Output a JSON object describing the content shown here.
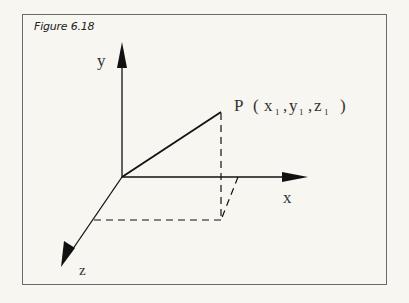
{
  "figure": {
    "caption": "Figure 6.18",
    "axes": {
      "x_label": "x",
      "y_label": "y",
      "z_label": "z"
    },
    "point": {
      "name": "P",
      "coords_text": "P (x₁ ,y₁ ,z₁ )",
      "label_parts": {
        "P": "P",
        "open": "(",
        "x": "x",
        "x_sub": "1",
        "y": "y",
        "y_sub": "1",
        "z": "z",
        "z_sub": "1",
        "close": ")"
      }
    },
    "colors": {
      "background": "#f7f6f1",
      "line": "#111111",
      "frame": "#6a6a6a",
      "text": "#333333"
    }
  }
}
